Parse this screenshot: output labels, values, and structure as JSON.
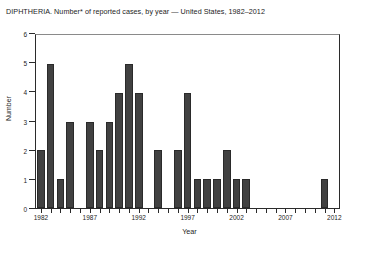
{
  "figure": {
    "title": "DIPHTHERIA. Number* of reported cases, by year — United States, 1982–2012",
    "x_axis_title": "Year",
    "y_axis_title": "Number"
  },
  "chart_data": {
    "type": "bar",
    "title": "DIPHTHERIA. Number* of reported cases, by year — United States, 1982–2012",
    "xlabel": "Year",
    "ylabel": "Number",
    "ylim": [
      0,
      6
    ],
    "yticks": [
      0,
      1,
      2,
      3,
      4,
      5,
      6
    ],
    "ytick_labels": [
      "0",
      "1",
      "2",
      "3",
      "4",
      "5",
      "6"
    ],
    "grid": false,
    "legend": null,
    "bar_color": "#414141",
    "categories": [
      "1982",
      "1983",
      "1984",
      "1985",
      "1986",
      "1987",
      "1988",
      "1989",
      "1990",
      "1991",
      "1992",
      "1993",
      "1994",
      "1995",
      "1996",
      "1997",
      "1998",
      "1999",
      "2000",
      "2001",
      "2002",
      "2003",
      "2004",
      "2005",
      "2006",
      "2007",
      "2008",
      "2009",
      "2010",
      "2011",
      "2012"
    ],
    "values": [
      2,
      5,
      1,
      3,
      0,
      3,
      2,
      3,
      4,
      5,
      4,
      0,
      2,
      0,
      2,
      4,
      1,
      1,
      1,
      2,
      1,
      1,
      0,
      0,
      0,
      0,
      0,
      0,
      0,
      1,
      0
    ],
    "xtick_labels": [
      "1982",
      "1987",
      "1992",
      "1997",
      "2002",
      "2007",
      "2012"
    ],
    "xtick_label_years": [
      1982,
      1987,
      1992,
      1997,
      2002,
      2007,
      2012
    ]
  }
}
